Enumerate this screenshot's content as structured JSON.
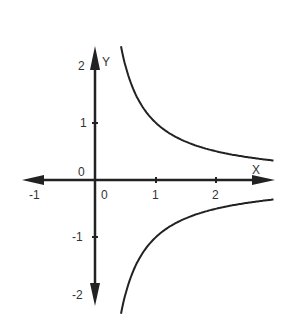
{
  "chart_data": {
    "type": "line",
    "title": "",
    "function": "y = 1/x",
    "xlabel": "X",
    "ylabel": "Y",
    "xlim": [
      -1,
      3
    ],
    "ylim": [
      -2.3,
      2.3
    ],
    "x_ticks": [
      "-1",
      "0",
      "1",
      "2"
    ],
    "y_ticks": [
      "2",
      "1",
      "0",
      "-1",
      "-2"
    ],
    "grid": false,
    "series": [
      {
        "name": "branch-positive",
        "x": [
          0.43,
          0.5,
          0.75,
          1,
          1.5,
          2,
          2.5,
          3
        ],
        "y": [
          2.3,
          2,
          1.33,
          1,
          0.67,
          0.5,
          0.4,
          0.33
        ]
      },
      {
        "name": "branch-negative",
        "x": [
          0.43,
          0.5,
          0.75,
          1,
          1.5,
          2,
          2.5,
          3
        ],
        "y": [
          -2.3,
          -2,
          -1.33,
          -1,
          -0.67,
          -0.5,
          -0.4,
          -0.33
        ]
      }
    ],
    "colors": {
      "axis": "#222222",
      "curve": "#222222"
    }
  }
}
